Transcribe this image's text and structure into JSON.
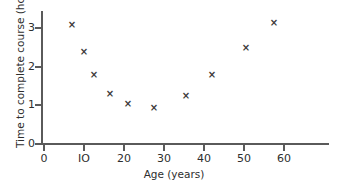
{
  "chart_data": {
    "type": "scatter",
    "title": "",
    "xlabel": "Age (years)",
    "ylabel": "Time to complete course (hours)",
    "xlim": [
      0,
      64
    ],
    "ylim": [
      0,
      3.45
    ],
    "grid": false,
    "legend": null,
    "marker_symbol": "×",
    "marker_color": "#3a3a3a",
    "xticks": [
      0,
      10,
      20,
      30,
      40,
      50,
      60
    ],
    "xtick_labels": [
      "0",
      "IO",
      "20",
      "30",
      "40",
      "50",
      "60"
    ],
    "yticks": [
      0,
      1,
      2,
      3
    ],
    "ytick_labels": [
      "0",
      "1",
      "2",
      "3"
    ],
    "x": [
      7,
      10,
      12.5,
      16.5,
      21,
      27.5,
      35.5,
      42,
      50.5,
      57.5
    ],
    "y": [
      3.1,
      2.4,
      1.8,
      1.3,
      1.05,
      0.95,
      1.25,
      1.8,
      2.5,
      3.15
    ],
    "points": [
      {
        "age": 7,
        "hours": 3.1
      },
      {
        "age": 10,
        "hours": 2.4
      },
      {
        "age": 12.5,
        "hours": 1.8
      },
      {
        "age": 16.5,
        "hours": 1.3
      },
      {
        "age": 21,
        "hours": 1.05
      },
      {
        "age": 27.5,
        "hours": 0.95
      },
      {
        "age": 35.5,
        "hours": 1.25
      },
      {
        "age": 42,
        "hours": 1.8
      },
      {
        "age": 50.5,
        "hours": 2.5
      },
      {
        "age": 57.5,
        "hours": 3.15
      }
    ]
  },
  "axes": {
    "axis_color": "#5a5a5a",
    "text_color": "#2e2e2e",
    "background": "#ffffff"
  }
}
